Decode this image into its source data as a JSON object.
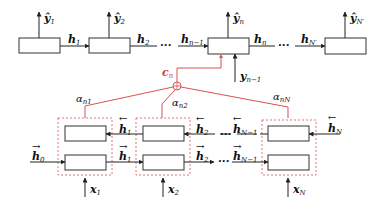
{
  "diagram": {
    "type": "attention-encoder-decoder",
    "colors": {
      "line": "#333333",
      "attention": "#d9534f",
      "dashed": "#d9534f"
    },
    "decoder": {
      "outputs": [
        "ŷ1",
        "ŷ2",
        "ŷn",
        "ŷN'"
      ],
      "hidden": [
        "h'1",
        "h'2",
        "h'n-1",
        "h'n",
        "h'N'"
      ],
      "input_prev": "yn-1",
      "ellipsis": "···"
    },
    "attention": {
      "context": "cn",
      "weights": [
        "αn1",
        "αn2",
        "αnN"
      ],
      "combiner": "⊕"
    },
    "encoder": {
      "backward": [
        "←h1",
        "←h2",
        "←hN-1",
        "←hN"
      ],
      "forward": [
        "→h0",
        "→h1",
        "→h2",
        "→hN-1"
      ],
      "inputs": [
        "x1",
        "x2",
        "xN"
      ],
      "ellipsis": "···"
    }
  },
  "labels": {
    "y1": "ŷ",
    "y1s": "1",
    "y2": "ŷ",
    "y2s": "2",
    "yn": "ŷ",
    "yns": "n",
    "yN": "ŷ",
    "yNs": "N′",
    "hp1": "h",
    "hp1s": "1",
    "hp2": "h",
    "hp2s": "2",
    "hpn1": "h",
    "hpn1s": "n−1",
    "hpn": "h",
    "hpns": "n",
    "hpN": "h",
    "hpNs": "N′",
    "prime": "′",
    "dots": "···",
    "yprev": "y",
    "yprevs": "n−1",
    "cn": "c",
    "cns": "n",
    "a1": "α",
    "a1s": "n1",
    "a2": "α",
    "a2s": "n2",
    "aN": "α",
    "aNs": "nN",
    "hb1": "h",
    "hb1s": "1",
    "hb2": "h",
    "hb2s": "2",
    "hbN1": "h",
    "hbN1s": "N−1",
    "hbN": "h",
    "hbNs": "N",
    "hf0": "h",
    "hf0s": "0",
    "hf1": "h",
    "hf1s": "1",
    "hf2": "h",
    "hf2s": "2",
    "hfN1": "h",
    "hfN1s": "N−1",
    "x1": "x",
    "x1s": "1",
    "x2": "x",
    "x2s": "2",
    "xN": "x",
    "xNs": "N",
    "larrow": "←",
    "rarrow": "→"
  }
}
